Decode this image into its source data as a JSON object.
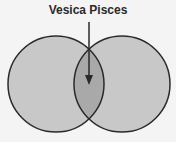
{
  "diagram": {
    "title": "Vesica Pisces",
    "colors": {
      "background": "#f4f4f4",
      "circle_fill": "#c8c8c8",
      "overlap_fill": "#a9a9a9",
      "stroke": "#2a2a2a"
    },
    "circles": [
      {
        "name": "left-circle",
        "cx": 56,
        "cy": 84,
        "r": 48
      },
      {
        "name": "right-circle",
        "cx": 122,
        "cy": 84,
        "r": 48
      }
    ],
    "arrow": {
      "x": 89,
      "y1": 22,
      "y2": 84
    }
  }
}
